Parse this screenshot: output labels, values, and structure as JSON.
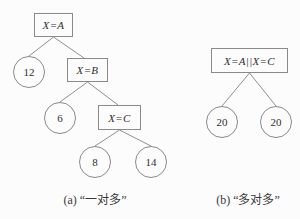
{
  "colors": {
    "background": "#fcfcfc",
    "line": "#909090",
    "node_border": "#8a8a8a",
    "text": "#2f2f2f"
  },
  "tree_a": {
    "nodes": {
      "root": "X=A",
      "b": "X=B",
      "c": "X=C"
    },
    "leaves": {
      "n12": "12",
      "n6": "6",
      "n8": "8",
      "n14": "14"
    },
    "caption": "(a) “一对多”"
  },
  "tree_b": {
    "nodes": {
      "root": "X=A||X=C"
    },
    "leaves": {
      "left": "20",
      "right": "20"
    },
    "caption": "(b) “多对多”"
  }
}
